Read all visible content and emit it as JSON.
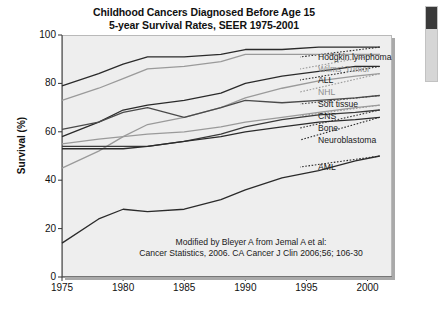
{
  "title": {
    "line1": "Childhood Cancers Diagnosed Before Age 15",
    "line2": "5-year Survival Rates, SEER 1975-2001"
  },
  "attribution": {
    "line1": "Modified by Bleyer A from Jemal A et al:",
    "line2": "Cancer Statistics, 2006. CA Cancer J Clin 2006;56; 106-30"
  },
  "axes": {
    "ylabel": "Survival (%)",
    "xlabel": "",
    "yticks": [
      "0",
      "20",
      "40",
      "60",
      "80",
      "100"
    ],
    "xticks": [
      "1975",
      "1980",
      "1985",
      "1990",
      "1995",
      "2000"
    ],
    "ylim": [
      0,
      100
    ],
    "xlim": [
      1975,
      2002
    ]
  },
  "scrollbar": {
    "visible": true
  },
  "chart_data": {
    "type": "line",
    "xlabel": "",
    "ylabel": "Survival (%)",
    "xlim": [
      1975,
      2002
    ],
    "ylim": [
      0,
      100
    ],
    "grid": false,
    "legend_position": "right-inline",
    "x": [
      1975,
      1978,
      1980,
      1982,
      1985,
      1988,
      1990,
      1993,
      1996,
      1999,
      2001
    ],
    "series": [
      {
        "name": "Hodgkin lymphoma",
        "color": "#2a2a2a",
        "values": [
          79,
          84,
          88,
          91,
          91,
          92,
          94,
          94,
          95,
          95,
          95
        ]
      },
      {
        "name": "Wilms' Tumor",
        "color": "#9a9a9a",
        "values": [
          73,
          78,
          82,
          86,
          87,
          89,
          92,
          92,
          92,
          92,
          92
        ]
      },
      {
        "name": "ALL",
        "color": "#2a2a2a",
        "values": [
          58,
          64,
          69,
          71,
          73,
          76,
          80,
          83,
          85,
          87,
          87
        ]
      },
      {
        "name": "NHL",
        "color": "#9a9a9a",
        "values": [
          45,
          52,
          58,
          63,
          66,
          70,
          74,
          78,
          81,
          83,
          84
        ]
      },
      {
        "name": "Soft tissue",
        "color": "#4a4a4a",
        "values": [
          61,
          64,
          68,
          70,
          66,
          70,
          73,
          72,
          73,
          74,
          75
        ]
      },
      {
        "name": "CNS",
        "color": "#9a9a9a",
        "values": [
          55,
          57,
          58,
          59,
          60,
          62,
          64,
          66,
          68,
          70,
          71
        ]
      },
      {
        "name": "Bone",
        "color": "#3a3a3a",
        "values": [
          54,
          54,
          54,
          54,
          56,
          59,
          62,
          65,
          67,
          68,
          69
        ]
      },
      {
        "name": "Neuroblastoma",
        "color": "#2a2a2a",
        "values": [
          53,
          53,
          53,
          54,
          56,
          58,
          60,
          62,
          64,
          65,
          66
        ]
      },
      {
        "name": "AML",
        "color": "#2a2a2a",
        "values": [
          14,
          24,
          28,
          27,
          28,
          32,
          36,
          41,
          44,
          48,
          50
        ]
      }
    ],
    "legend_entries": [
      {
        "label": "Hodgkin lymphoma",
        "faint": false
      },
      {
        "label": "Wilms' Tumor",
        "faint": true
      },
      {
        "label": "ALL",
        "faint": false
      },
      {
        "label": "NHL",
        "faint": true
      },
      {
        "label": "Soft tissue",
        "faint": false
      },
      {
        "label": "CNS",
        "faint": false
      },
      {
        "label": "Bone",
        "faint": false
      },
      {
        "label": "Neuroblastoma",
        "faint": false
      },
      {
        "label": "AML",
        "faint": false
      }
    ]
  }
}
